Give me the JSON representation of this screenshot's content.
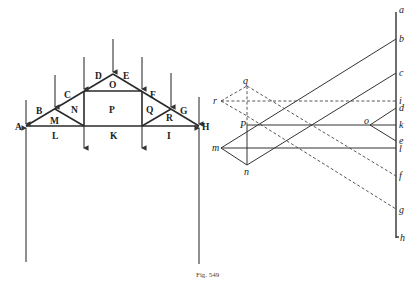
{
  "figure": {
    "caption": "Fig. 549",
    "truss": {
      "space_labels": {
        "A": "A",
        "B": "B",
        "C": "C",
        "D": "D",
        "E": "E",
        "F": "F",
        "G": "G",
        "H": "H",
        "I": "I",
        "K": "K",
        "L": "L",
        "M": "M",
        "N": "N",
        "O": "O",
        "P": "P",
        "Q": "Q",
        "R": "R"
      }
    },
    "force_diagram": {
      "load_line_points": [
        "a",
        "b",
        "c",
        "i",
        "d",
        "k",
        "e",
        "l",
        "f",
        "g",
        "h"
      ],
      "pole_points": [
        "q",
        "r",
        "p",
        "m",
        "n",
        "o"
      ],
      "labels": {
        "a": "a",
        "b": "b",
        "c": "c",
        "i": "i",
        "d": "d",
        "k": "k",
        "e": "e",
        "l": "l",
        "f": "f",
        "g": "g",
        "h": "h",
        "q": "q",
        "r": "r",
        "p": "P",
        "m": "m",
        "n": "n",
        "o": "o"
      }
    }
  }
}
